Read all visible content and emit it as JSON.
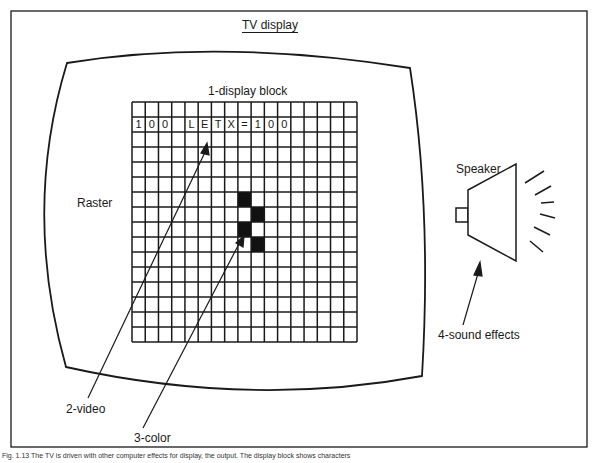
{
  "diagram": {
    "title": "TV display",
    "labels": {
      "display_block": "1-display block",
      "raster": "Raster",
      "speaker": "Speaker",
      "video": "2-video",
      "color": "3-color",
      "sound": "4-sound effects"
    },
    "grid": {
      "columns": 17,
      "rows": 16,
      "text_row": 1,
      "text_cells": [
        "1",
        "0",
        "0",
        "",
        "L",
        "E",
        "T",
        "X",
        "=",
        "1",
        "0",
        "0",
        "",
        "",
        "",
        "",
        ""
      ],
      "filled_cells": [
        [
          8,
          6
        ],
        [
          9,
          7
        ],
        [
          8,
          8
        ],
        [
          9,
          9
        ]
      ]
    },
    "caption": "Fig. 1.13 The TV is driven with other computer effects for display, the output. The display block shows characters"
  }
}
